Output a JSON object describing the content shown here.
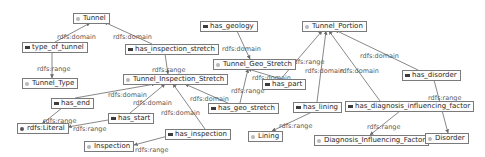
{
  "diagram": {
    "type": "ontology-graph",
    "colors": {
      "edge": "#6a6a6a",
      "node_border": "#7a7a7a",
      "class_icon": "#b8b8b8",
      "property_icon": "#3c3c3c",
      "label": "#5a5a5a"
    },
    "nodes": [
      {
        "id": "tunnel",
        "label": "Tunnel",
        "kind": "class",
        "x": 73,
        "y": 13
      },
      {
        "id": "type_of_tunnel",
        "label": "type_of_tunnel",
        "kind": "property",
        "x": 22,
        "y": 42
      },
      {
        "id": "has_inspection_stretch",
        "label": "has_inspection_stretch",
        "kind": "property",
        "x": 125,
        "y": 44
      },
      {
        "id": "tunnel_type",
        "label": "Tunnel_Type",
        "kind": "class",
        "x": 22,
        "y": 78
      },
      {
        "id": "has_geology",
        "label": "has_geology",
        "kind": "property",
        "x": 200,
        "y": 21
      },
      {
        "id": "tunnel_geo_stretch",
        "label": "Tunnel_Geo_Stretch",
        "kind": "class",
        "x": 213,
        "y": 59
      },
      {
        "id": "tunnel_portion",
        "label": "Tunnel_Portion",
        "kind": "class",
        "x": 302,
        "y": 21
      },
      {
        "id": "tunnel_inspection_stretch",
        "label": "Tunnel_Inspection_Stretch",
        "kind": "class",
        "x": 123,
        "y": 74
      },
      {
        "id": "has_part",
        "label": "has_part",
        "kind": "property",
        "x": 262,
        "y": 79
      },
      {
        "id": "has_disorder",
        "label": "has_disorder",
        "kind": "property",
        "x": 402,
        "y": 70
      },
      {
        "id": "has_end",
        "label": "has_end",
        "kind": "property",
        "x": 51,
        "y": 98
      },
      {
        "id": "has_start",
        "label": "has_start",
        "kind": "property",
        "x": 108,
        "y": 113
      },
      {
        "id": "rdfs_literal",
        "label": "rdfs:Literal",
        "kind": "literal",
        "x": 17,
        "y": 123
      },
      {
        "id": "has_geo_stretch",
        "label": "has_geo_stretch",
        "kind": "property",
        "x": 208,
        "y": 103
      },
      {
        "id": "has_lining",
        "label": "has_lining",
        "kind": "property",
        "x": 293,
        "y": 102
      },
      {
        "id": "has_diagnosis_influencing_factor",
        "label": "has_diagnosis_influencing_factor",
        "kind": "property",
        "x": 345,
        "y": 101
      },
      {
        "id": "has_inspection",
        "label": "has_inspection",
        "kind": "property",
        "x": 165,
        "y": 129
      },
      {
        "id": "inspection",
        "label": "Inspection",
        "kind": "class",
        "x": 84,
        "y": 141
      },
      {
        "id": "lining",
        "label": "Lining",
        "kind": "class",
        "x": 248,
        "y": 131
      },
      {
        "id": "diagnosis_influencing_factor",
        "label": "Diagnosis_Influencing_Factor",
        "kind": "class",
        "x": 314,
        "y": 135
      },
      {
        "id": "disorder",
        "label": "Disorder",
        "kind": "class",
        "x": 425,
        "y": 133
      }
    ],
    "edges": [
      {
        "from": [
          55,
          42
        ],
        "to": [
          90,
          23
        ],
        "label": "rdfs:domain",
        "lx": 57,
        "ly": 33
      },
      {
        "from": [
          152,
          44
        ],
        "to": [
          104,
          22
        ],
        "label": "rdfs:domain",
        "lx": 113,
        "ly": 33
      },
      {
        "from": [
          52,
          52
        ],
        "to": [
          52,
          78
        ],
        "label": "rdfs:range",
        "lx": 37,
        "ly": 65
      },
      {
        "from": [
          165,
          54
        ],
        "to": [
          168,
          74
        ],
        "label": "rdfs:range",
        "lx": 152,
        "ly": 66
      },
      {
        "from": [
          237,
          31
        ],
        "to": [
          250,
          59
        ],
        "label": "rdfs:domain",
        "lx": 222,
        "ly": 45
      },
      {
        "from": [
          284,
          80
        ],
        "to": [
          248,
          69
        ],
        "label": "rdfs:domain",
        "lx": 252,
        "ly": 74
      },
      {
        "from": [
          280,
          80
        ],
        "to": [
          322,
          31
        ],
        "label": "rdfs:range",
        "lx": 291,
        "ly": 58
      },
      {
        "from": [
          317,
          102
        ],
        "to": [
          326,
          31
        ],
        "label": "rdfs:domain",
        "lx": 305,
        "ly": 67
      },
      {
        "from": [
          380,
          101
        ],
        "to": [
          329,
          31
        ],
        "label": "rdfs:domain",
        "lx": 340,
        "ly": 67
      },
      {
        "from": [
          418,
          70
        ],
        "to": [
          335,
          30
        ],
        "label": "rdfs:domain",
        "lx": 360,
        "ly": 52
      },
      {
        "from": [
          75,
          98
        ],
        "to": [
          155,
          84
        ],
        "label": "rdfs:domain",
        "lx": 108,
        "ly": 91
      },
      {
        "from": [
          130,
          113
        ],
        "to": [
          165,
          84
        ],
        "label": "rdfs:domain",
        "lx": 133,
        "ly": 99
      },
      {
        "from": [
          205,
          129
        ],
        "to": [
          173,
          84
        ],
        "label": "rdfs:domain",
        "lx": 161,
        "ly": 109
      },
      {
        "from": [
          230,
          104
        ],
        "to": [
          185,
          84
        ],
        "label": "rdfs:domain",
        "lx": 190,
        "ly": 95
      },
      {
        "from": [
          240,
          103
        ],
        "to": [
          248,
          69
        ],
        "label": "rdfs:range",
        "lx": 231,
        "ly": 87
      },
      {
        "from": [
          62,
          108
        ],
        "to": [
          42,
          124
        ],
        "label": "rdfs:range",
        "lx": 43,
        "ly": 117
      },
      {
        "from": [
          108,
          120
        ],
        "to": [
          68,
          127
        ],
        "label": "rdfs:range",
        "lx": 73,
        "ly": 125
      },
      {
        "from": [
          168,
          136
        ],
        "to": [
          134,
          145
        ],
        "label": "rdfs:range",
        "lx": 135,
        "ly": 146
      },
      {
        "from": [
          312,
          112
        ],
        "to": [
          272,
          131
        ],
        "label": "rdfs:range",
        "lx": 279,
        "ly": 122
      },
      {
        "from": [
          400,
          111
        ],
        "to": [
          370,
          135
        ],
        "label": "rdfs:range",
        "lx": 367,
        "ly": 123
      },
      {
        "from": [
          434,
          80
        ],
        "to": [
          448,
          133
        ],
        "label": "rdfs:range",
        "lx": 428,
        "ly": 94
      }
    ]
  }
}
